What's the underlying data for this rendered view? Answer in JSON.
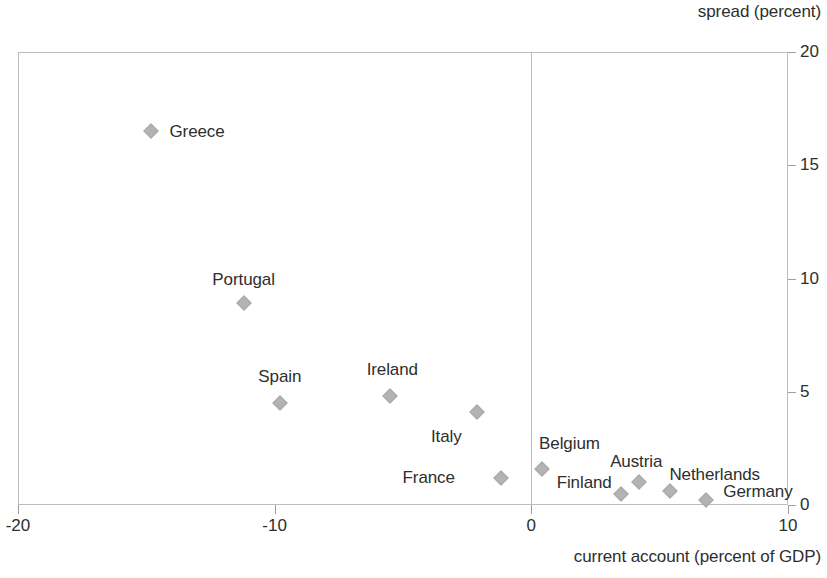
{
  "chart_data": {
    "type": "scatter",
    "title": "",
    "xlabel": "current account (percent of GDP)",
    "ylabel": "spread (percent)",
    "xlim": [
      -20,
      10
    ],
    "ylim": [
      0,
      20
    ],
    "xticks": [
      "-20",
      "-10",
      "0",
      "10"
    ],
    "xtick_values": [
      -20,
      -10,
      0,
      10
    ],
    "yticks": [
      "0",
      "5",
      "10",
      "15",
      "20"
    ],
    "ytick_values": [
      0,
      5,
      10,
      15,
      20
    ],
    "grid": false,
    "legend": "none",
    "y_axis_position": "right",
    "marker_color": "#b3b3b3",
    "text_color": "#2e2e2e",
    "frame_color": "#bdbdbd",
    "points": [
      {
        "label": "Greece",
        "x": -14.8,
        "y": 16.5,
        "label_dx": 18,
        "label_dy": 0,
        "label_align": "left"
      },
      {
        "label": "Portugal",
        "x": -11.2,
        "y": 8.9,
        "label_dx": 0,
        "label_dy": -24,
        "label_align": "center"
      },
      {
        "label": "Spain",
        "x": -9.8,
        "y": 4.5,
        "label_dx": 0,
        "label_dy": -27,
        "label_align": "center"
      },
      {
        "label": "Ireland",
        "x": -5.5,
        "y": 4.8,
        "label_dx": 2,
        "label_dy": -27,
        "label_align": "center"
      },
      {
        "label": "Italy",
        "x": -2.1,
        "y": 4.1,
        "label_dx": -31,
        "label_dy": 24,
        "label_align": "center"
      },
      {
        "label": "France",
        "x": -1.2,
        "y": 1.2,
        "label_dx": -46,
        "label_dy": 0,
        "label_align": "right"
      },
      {
        "label": "Belgium",
        "x": 0.4,
        "y": 1.6,
        "label_dx": 28,
        "label_dy": -25,
        "label_align": "center"
      },
      {
        "label": "Finland",
        "x": 3.5,
        "y": 0.5,
        "label_dx": -37,
        "label_dy": -11,
        "label_align": "center"
      },
      {
        "label": "Austria",
        "x": 4.2,
        "y": 1.0,
        "label_dx": -3,
        "label_dy": -21,
        "label_align": "center"
      },
      {
        "label": "Netherlands",
        "x": 5.4,
        "y": 0.6,
        "label_dx": 45,
        "label_dy": -17,
        "label_align": "center"
      },
      {
        "label": "Germany",
        "x": 6.8,
        "y": 0.2,
        "label_dx": 52,
        "label_dy": -9,
        "label_align": "center"
      }
    ]
  }
}
